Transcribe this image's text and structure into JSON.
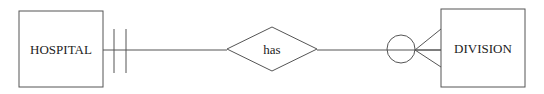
{
  "diagram": {
    "type": "er-diagram",
    "notation": "crows-foot",
    "entities": [
      {
        "id": "hospital",
        "label": "HOSPITAL"
      },
      {
        "id": "division",
        "label": "DIVISION"
      }
    ],
    "relationship": {
      "id": "has",
      "label": "has"
    },
    "cardinality": {
      "hospital_side": "one-and-only-one",
      "division_side": "zero-or-many"
    },
    "colors": {
      "stroke": "#555555",
      "text": "#222222",
      "background": "#ffffff"
    }
  }
}
